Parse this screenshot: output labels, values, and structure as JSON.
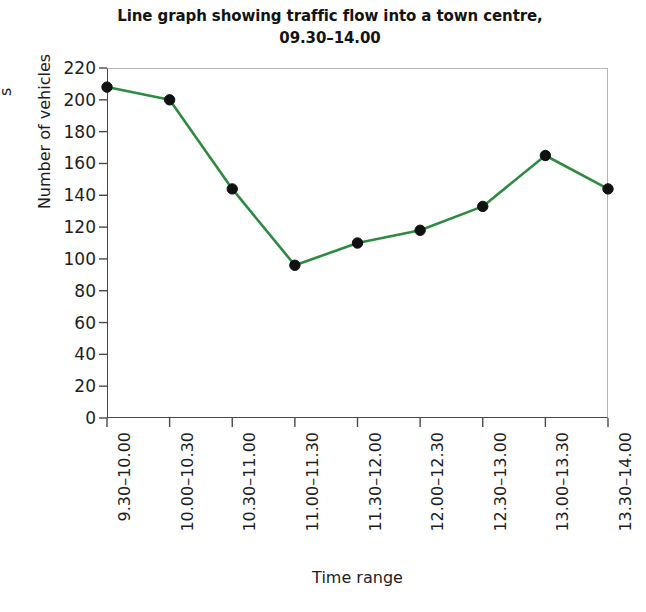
{
  "chart_data": {
    "type": "line",
    "title": "Line graph showing traffic flow into a town centre, 09.30–14.00",
    "title_line1": "Line graph showing traffic flow into a town centre,",
    "title_line2": "09.30–14.00",
    "xlabel": "Time range",
    "ylabel": "Number of vehicles",
    "ylim": [
      0,
      220
    ],
    "ytick_step": 20,
    "grid": false,
    "legend": "none",
    "line_color": "#2f8a41",
    "marker_color": "#111111",
    "categories": [
      "9.30–10.00",
      "10.00–10.30",
      "10.30–11.00",
      "11.00–11.30",
      "11.30–12.00",
      "12.00–12.30",
      "12.30–13.00",
      "13.00–13.30",
      "13.30–14.00"
    ],
    "values": [
      208,
      200,
      144,
      96,
      110,
      118,
      133,
      165,
      144
    ],
    "yticks": [
      0,
      20,
      40,
      60,
      80,
      100,
      120,
      140,
      160,
      180,
      200,
      220
    ],
    "ytick_labels": [
      "0",
      "20",
      "40",
      "60",
      "80",
      "100",
      "120",
      "140",
      "160",
      "180",
      "200",
      "220"
    ]
  },
  "edge_fragment": "s"
}
